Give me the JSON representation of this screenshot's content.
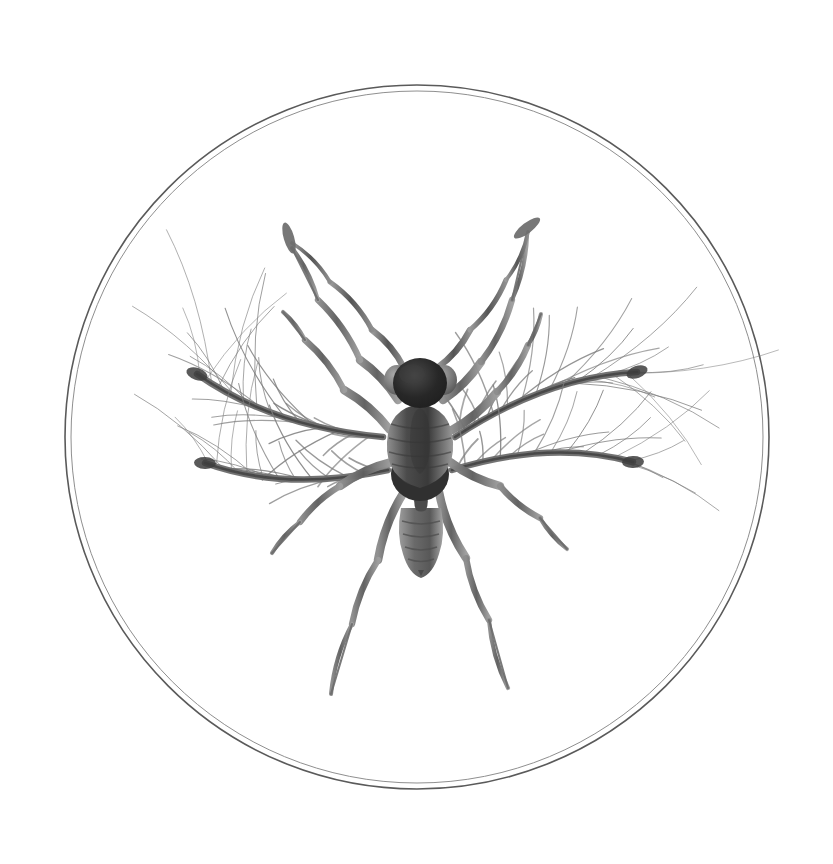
{
  "document": {
    "title": "Plumose-winged micro-insect specimen plate",
    "medium": "grayscale scientific illustration",
    "background_color": "#ffffff",
    "has_visible_text": false,
    "caption": ""
  },
  "vignette": {
    "name": "circular specimen frame",
    "shape": "circle",
    "style": "double concentric thin line",
    "center_x": 417,
    "center_y": 437,
    "outer_radius": 352,
    "inner_radius": 346,
    "outer_stroke_color": "#5a5a5a",
    "inner_stroke_color": "#8f8f8f",
    "outer_stroke_width": 1.6,
    "inner_stroke_width": 1.0,
    "fill": "#ffffff"
  },
  "palette": {
    "ink_darkest": "#262626",
    "ink_dark": "#3d3d3d",
    "ink_mid": "#6b6b6b",
    "ink_light": "#8e8e8e",
    "ink_faint": "#a9a9a9",
    "ink_hair": "#7d7d7d",
    "paper": "#ffffff"
  },
  "specimen": {
    "name": "micro-insect",
    "common_name": "fairyfly-like micro-hymenopteran",
    "orientation": "dorsal view, head up",
    "center_x": 417,
    "center_y": 455,
    "body": {
      "head": {
        "name": "head",
        "cx": 420,
        "cy": 383,
        "rx": 27,
        "ry": 24,
        "color": "#2b2b2b"
      },
      "eyes": [
        {
          "name": "left-compound-eye",
          "cx": 396,
          "cy": 379,
          "rx": 12,
          "ry": 14,
          "color": "#6f6f6f"
        },
        {
          "name": "right-compound-eye",
          "cx": 446,
          "cy": 379,
          "rx": 12,
          "ry": 14,
          "color": "#6f6f6f"
        }
      ],
      "thorax": {
        "name": "thorax",
        "cx": 420,
        "cy": 440,
        "rx": 30,
        "ry": 52,
        "color": "#555555",
        "segment_bands": 5
      },
      "mesosoma_dark": {
        "name": "propodeum",
        "cx": 420,
        "cy": 473,
        "rx": 29,
        "ry": 26,
        "color": "#333333"
      },
      "petiole": {
        "name": "petiole",
        "cx": 420,
        "cy": 505,
        "rx": 5,
        "ry": 10,
        "color": "#4a4a4a"
      },
      "abdomen": {
        "name": "abdomen",
        "cx": 421,
        "cy": 534,
        "rx": 20,
        "ry": 32,
        "color": "#6a6a6a",
        "segment_bands": 4,
        "tip_y": 574
      }
    },
    "antennae": [
      {
        "name": "left-antenna",
        "side": "left",
        "tip_x": 289,
        "tip_y": 238
      },
      {
        "name": "right-antenna",
        "side": "right",
        "tip_x": 527,
        "tip_y": 228
      }
    ],
    "plumose_wings": [
      {
        "name": "left-upper-plumose-wing",
        "side": "left",
        "shaft_from_x": 383,
        "shaft_from_y": 437,
        "shaft_to_x": 197,
        "shaft_to_y": 374,
        "fibril_count": 26,
        "fibril_length": 118,
        "fan_start_deg": 152,
        "fan_end_deg": 290
      },
      {
        "name": "left-lower-plumose-wing",
        "side": "left",
        "shaft_from_x": 388,
        "shaft_from_y": 470,
        "shaft_to_x": 205,
        "shaft_to_y": 463,
        "fibril_count": 22,
        "fibril_length": 92,
        "fan_start_deg": 170,
        "fan_end_deg": 265
      },
      {
        "name": "right-upper-plumose-wing",
        "side": "right",
        "shaft_from_x": 455,
        "shaft_from_y": 437,
        "shaft_to_x": 637,
        "shaft_to_y": 372,
        "fibril_count": 26,
        "fibril_length": 118,
        "fan_start_deg": 250,
        "fan_end_deg": 388
      },
      {
        "name": "right-lower-plumose-wing",
        "side": "right",
        "shaft_from_x": 452,
        "shaft_from_y": 470,
        "shaft_to_x": 633,
        "shaft_to_y": 462,
        "fibril_count": 22,
        "fibril_length": 92,
        "fan_start_deg": 275,
        "fan_end_deg": 370
      }
    ],
    "legs": [
      {
        "name": "front-left-leg",
        "side": "left",
        "pair": "front",
        "tip_x": 288,
        "tip_y": 243
      },
      {
        "name": "front-right-leg",
        "side": "right",
        "pair": "front",
        "tip_x": 528,
        "tip_y": 230
      },
      {
        "name": "middle-left-leg",
        "side": "left",
        "pair": "middle",
        "tip_x": 282,
        "tip_y": 309
      },
      {
        "name": "middle-right-leg",
        "side": "right",
        "pair": "middle",
        "tip_x": 540,
        "tip_y": 312
      },
      {
        "name": "hind-left-leg",
        "side": "left",
        "pair": "hind",
        "tip_x": 271,
        "tip_y": 551
      },
      {
        "name": "hind-right-leg",
        "side": "right",
        "pair": "hind",
        "tip_x": 568,
        "tip_y": 547
      },
      {
        "name": "rear-left-leg",
        "side": "left",
        "pair": "rear",
        "tip_x": 332,
        "tip_y": 692
      },
      {
        "name": "rear-right-leg",
        "side": "right",
        "pair": "rear",
        "tip_x": 507,
        "tip_y": 686
      }
    ]
  }
}
